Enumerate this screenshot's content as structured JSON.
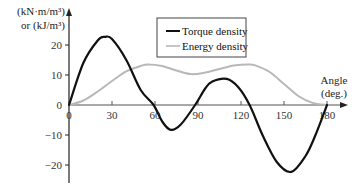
{
  "chart_data": {
    "type": "line",
    "title": "",
    "xlabel": "Angle (deg.)",
    "ylabel_line1": "(kN·m/m³)",
    "ylabel_line2": "or (kJ/m³)",
    "xlim": [
      0,
      180
    ],
    "ylim": [
      -27,
      27
    ],
    "x_ticks": [
      0,
      30,
      60,
      90,
      120,
      150,
      180
    ],
    "y_ticks": [
      20,
      10,
      0,
      -10,
      -20
    ],
    "grid": false,
    "legend_position": "top-center",
    "legend": [
      "Torque density",
      "Energy density"
    ],
    "series": [
      {
        "name": "Torque density",
        "color": "#111111",
        "x": [
          0,
          10,
          20,
          25,
          30,
          40,
          50,
          59,
          65,
          71,
          78,
          88,
          95,
          100,
          110,
          118,
          126,
          135,
          145,
          155,
          165,
          172,
          180
        ],
        "values": [
          0,
          14,
          21.5,
          22.7,
          22,
          15,
          5,
          0,
          -5.5,
          -8.3,
          -6.5,
          0,
          5.5,
          7.8,
          8.7,
          6,
          0,
          -10,
          -19,
          -22.3,
          -17,
          -10,
          0
        ]
      },
      {
        "name": "Energy density",
        "color": "#b8b8b8",
        "x": [
          0,
          10,
          20,
          30,
          40,
          50,
          55,
          65,
          75,
          85,
          95,
          105,
          115,
          125,
          130,
          140,
          150,
          160,
          170,
          180
        ],
        "values": [
          0,
          1.5,
          4.5,
          8,
          11.2,
          13,
          13.5,
          13,
          11.5,
          10.3,
          10.8,
          12,
          13.2,
          13.5,
          13.2,
          11,
          7,
          3,
          0.7,
          0
        ]
      }
    ]
  }
}
